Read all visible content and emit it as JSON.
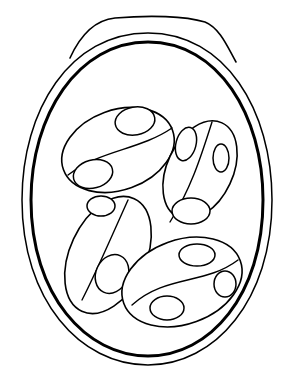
{
  "figure": {
    "colors": {
      "ink": "#000000",
      "background": "#ffffff"
    },
    "sporocyst_count": 4,
    "nucleus_count_per_sporocyst": 2
  }
}
